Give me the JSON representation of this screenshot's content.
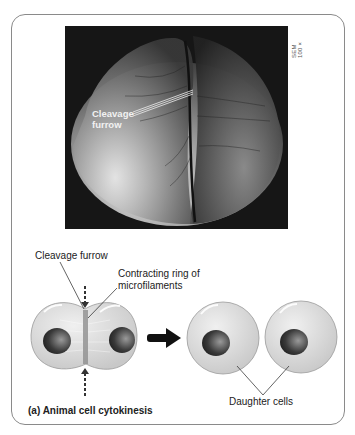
{
  "figure": {
    "panel_label": "(a) Animal cell cytokinesis",
    "micrograph": {
      "type": "SEM",
      "scale_label": "SEM 100×",
      "annotation": {
        "line1": "Cleavage",
        "line2": "furrow"
      }
    },
    "diagram": {
      "labels": {
        "cleavage_furrow": "Cleavage furrow",
        "ring_line1": "Contracting ring of",
        "ring_line2": "microfilaments",
        "daughter_cells": "Daughter cells"
      },
      "colors": {
        "cell_fill": "#d9d9d9",
        "cell_stroke": "#9a9a9a",
        "nucleus_dark": "#2a2a2a",
        "nucleus_light": "#8c8c8c",
        "arrow": "#111111"
      }
    }
  }
}
